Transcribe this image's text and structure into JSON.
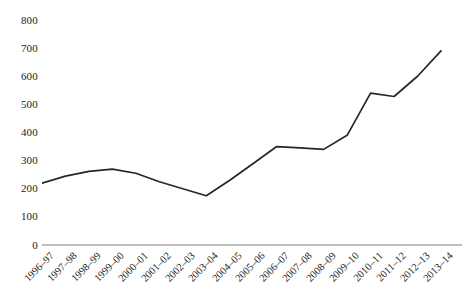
{
  "chart_data": {
    "type": "line",
    "title": "",
    "xlabel": "",
    "ylabel": "",
    "ylim": [
      0,
      800
    ],
    "yticks": [
      0,
      100,
      200,
      300,
      400,
      500,
      600,
      700,
      800
    ],
    "grid": false,
    "legend": "none",
    "line_color": "#262626",
    "categories": [
      "1996–97",
      "1997–98",
      "1998–99",
      "1999–00",
      "2000–01",
      "2001–02",
      "2002–03",
      "2003–04",
      "2004–05",
      "2005–06",
      "2006–07",
      "2007–08",
      "2008–09",
      "2009–10",
      "2010–11",
      "2011–12",
      "2012–13",
      "2013–14"
    ],
    "values": [
      220,
      245,
      262,
      270,
      255,
      225,
      200,
      175,
      230,
      290,
      350,
      345,
      340,
      390,
      540,
      528,
      600,
      690
    ],
    "series": [
      {
        "name": "series-1",
        "values": [
          220,
          245,
          262,
          270,
          255,
          225,
          200,
          175,
          230,
          290,
          350,
          345,
          340,
          390,
          540,
          528,
          600,
          690
        ]
      }
    ]
  }
}
